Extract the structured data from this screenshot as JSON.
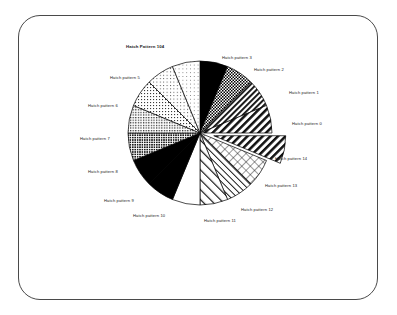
{
  "figure": {
    "frame": {
      "shape": "rounded-rectangle",
      "border_color": "#4a4a4a",
      "background": "#ffffff"
    },
    "background": "#ffffff"
  },
  "chart_data": {
    "type": "pie",
    "title": "",
    "subtitle": "",
    "xlabel": "",
    "ylabel": "",
    "grid": false,
    "legend_position": "none",
    "label_style": "outside-leader",
    "start_angle_deg": -90,
    "direction": "clockwise",
    "exploded_index": 4,
    "explode_offset_px": 14,
    "center_px": [
      200,
      133
    ],
    "radius_px": 72,
    "categories": [
      "Hatch pattern 0",
      "Hatch pattern 1",
      "Hatch pattern 2",
      "Hatch pattern 3",
      "Hatch Pattern 104",
      "Hatch pattern 5",
      "Hatch pattern 6",
      "Hatch pattern 7",
      "Hatch pattern 8",
      "Hatch pattern 9",
      "Hatch pattern 10",
      "Hatch pattern 11",
      "Hatch pattern 12",
      "Hatch pattern 13",
      "Hatch pattern 14",
      "Hatch pattern 15"
    ],
    "values": [
      6.25,
      6.25,
      6.25,
      6.25,
      6.25,
      6.25,
      6.25,
      6.25,
      6.25,
      6.25,
      6.25,
      6.25,
      6.25,
      6.25,
      6.25,
      6.25
    ],
    "slice_angles_deg": [
      22.5,
      22.5,
      22.5,
      22.5,
      22.5,
      22.5,
      22.5,
      22.5,
      22.5,
      22.5,
      22.5,
      22.5,
      22.5,
      22.5,
      22.5,
      22.5
    ],
    "fills": [
      "solid-black",
      "checkerboard-dense",
      "diagonal-stripe-right",
      "diagonal-stripe-right-wide",
      "diagonal-stripe-right-wide",
      "cross-hatch-diamond",
      "diagonal-stripe-left-fine",
      "diagonal-stripe-left-wide",
      "white-blank",
      "solid-black",
      "solid-black",
      "stipple-dark",
      "stipple-medium",
      "stipple-light",
      "stipple-very-light",
      "stipple-faint"
    ]
  },
  "labels": [
    {
      "id": "label-0",
      "text": "Hatch pattern 0",
      "x": 292,
      "y": 122,
      "exploded": false
    },
    {
      "id": "label-1",
      "text": "Hatch pattern 1",
      "x": 289,
      "y": 91,
      "exploded": false
    },
    {
      "id": "label-2",
      "text": "Hatch pattern 2",
      "x": 254,
      "y": 68,
      "exploded": false
    },
    {
      "id": "label-3",
      "text": "Hatch pattern 3",
      "x": 222,
      "y": 56,
      "exploded": false
    },
    {
      "id": "label-4",
      "text": "Hatch Pattern 104",
      "x": 126,
      "y": 45,
      "exploded": true
    },
    {
      "id": "label-5",
      "text": "Hatch pattern 5",
      "x": 110,
      "y": 76,
      "exploded": false
    },
    {
      "id": "label-6",
      "text": "Hatch pattern 6",
      "x": 88,
      "y": 104,
      "exploded": false
    },
    {
      "id": "label-7",
      "text": "Hatch pattern 7",
      "x": 80,
      "y": 137,
      "exploded": false
    },
    {
      "id": "label-8",
      "text": "Hatch pattern 8",
      "x": 88,
      "y": 170,
      "exploded": false
    },
    {
      "id": "label-9",
      "text": "Hatch pattern 9",
      "x": 104,
      "y": 199,
      "exploded": false
    },
    {
      "id": "label-10",
      "text": "Hatch pattern 10",
      "x": 133,
      "y": 214,
      "exploded": false
    },
    {
      "id": "label-11",
      "text": "Hatch pattern 11",
      "x": 204,
      "y": 219,
      "exploded": false
    },
    {
      "id": "label-12",
      "text": "Hatch pattern 12",
      "x": 241,
      "y": 208,
      "exploded": false
    },
    {
      "id": "label-13",
      "text": "Hatch pattern 13",
      "x": 265,
      "y": 184,
      "exploded": false
    },
    {
      "id": "label-14",
      "text": "Hatch pattern 14",
      "x": 275,
      "y": 157,
      "exploded": false
    }
  ]
}
